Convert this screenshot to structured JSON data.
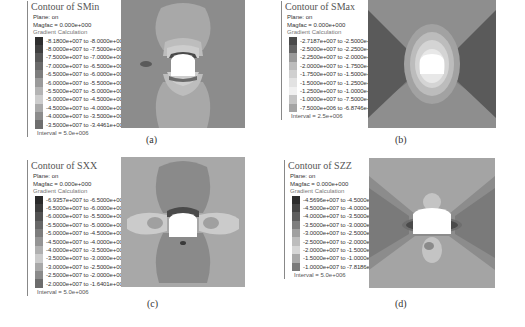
{
  "figure": {
    "panels": [
      {
        "id": "a",
        "caption": "(a)",
        "legend": {
          "title": "Contour of SMin",
          "plane": "Plane: on",
          "magfac": "Magfac =  0.000e+000",
          "gradient": "Gradient Calculation",
          "rows": [
            {
              "label": "-8.1800e+007 to -8.0000e+007",
              "color": "#2e2e2e"
            },
            {
              "label": "-8.0000e+007 to -7.5000e+007",
              "color": "#3f3f3f"
            },
            {
              "label": "-7.5000e+007 to -7.0000e+007",
              "color": "#575757"
            },
            {
              "label": "-7.0000e+007 to -6.5000e+007",
              "color": "#6a6a6a"
            },
            {
              "label": "-6.5000e+007 to -6.0000e+007",
              "color": "#7d7d7d"
            },
            {
              "label": "-6.0000e+007 to -5.5000e+007",
              "color": "#9a9a9a"
            },
            {
              "label": "-5.5000e+007 to -5.0000e+007",
              "color": "#b4b4b4"
            },
            {
              "label": "-5.0000e+007 to -4.5000e+007",
              "color": "#cdcdcd"
            },
            {
              "label": "-4.5000e+007 to -4.0000e+007",
              "color": "#a9a9a9"
            },
            {
              "label": "-4.0000e+007 to -3.5000e+007",
              "color": "#8c8c8c"
            },
            {
              "label": "-3.5000e+007 to -3.4461e+007",
              "color": "#6e6e6e"
            }
          ],
          "interval": "Interval =  5.0e+006"
        }
      },
      {
        "id": "b",
        "caption": "(b)",
        "legend": {
          "title": "Contour of SMax",
          "plane": "Plane: on",
          "magfac": "Magfac =  0.000e+000",
          "gradient": "Gradient Calculation",
          "rows": [
            {
              "label": "-2.7187e+007 to -2.5000e+007",
              "color": "#4a4a4a"
            },
            {
              "label": "-2.5000e+007 to -2.2500e+007",
              "color": "#646464"
            },
            {
              "label": "-2.2500e+007 to -2.0000e+007",
              "color": "#9a9a9a"
            },
            {
              "label": "-2.0000e+007 to -1.7500e+007",
              "color": "#bcbcbc"
            },
            {
              "label": "-1.7500e+007 to -1.5000e+007",
              "color": "#d0d0d0"
            },
            {
              "label": "-1.5000e+007 to -1.2500e+007",
              "color": "#e2e2e2"
            },
            {
              "label": "-1.2500e+007 to -1.0000e+007",
              "color": "#f0f0f0"
            },
            {
              "label": "-1.0000e+007 to -7.5000e+006",
              "color": "#c4c4c4"
            },
            {
              "label": "-7.5000e+006 to -6.8746e+006",
              "color": "#a4a4a4"
            }
          ],
          "interval": "Interval =  2.5e+006"
        }
      },
      {
        "id": "c",
        "caption": "(c)",
        "legend": {
          "title": "Contour of SXX",
          "plane": "Plane: on",
          "magfac": "Magfac =  0.000e+000",
          "gradient": "Gradient Calculation",
          "rows": [
            {
              "label": "-6.9357e+007 to -6.5000e+007",
              "color": "#2a2a2a"
            },
            {
              "label": "-6.5000e+007 to -6.0000e+007",
              "color": "#3c3c3c"
            },
            {
              "label": "-6.0000e+007 to -5.5000e+007",
              "color": "#525252"
            },
            {
              "label": "-5.5000e+007 to -5.0000e+007",
              "color": "#676767"
            },
            {
              "label": "-5.0000e+007 to -4.5000e+007",
              "color": "#7c7c7c"
            },
            {
              "label": "-4.5000e+007 to -4.0000e+007",
              "color": "#949494"
            },
            {
              "label": "-4.0000e+007 to -3.5000e+007",
              "color": "#b0b0b0"
            },
            {
              "label": "-3.5000e+007 to -3.0000e+007",
              "color": "#cbcbcb"
            },
            {
              "label": "-3.0000e+007 to -2.5000e+007",
              "color": "#a8a8a8"
            },
            {
              "label": "-2.5000e+007 to -2.0000e+007",
              "color": "#8a8a8a"
            },
            {
              "label": "-2.0000e+007 to -1.6401e+007",
              "color": "#6c6c6c"
            }
          ],
          "interval": "Interval =  5.0e+006"
        }
      },
      {
        "id": "d",
        "caption": "(d)",
        "legend": {
          "title": "Contour of SZZ",
          "plane": "Plane: on",
          "magfac": "Magfac =  0.000e+000",
          "gradient": "Gradient Calculation",
          "rows": [
            {
              "label": "-4.5696e+007 to -4.5000e+007",
              "color": "#2c2c2c"
            },
            {
              "label": "-4.5000e+007 to -4.0000e+007",
              "color": "#444444"
            },
            {
              "label": "-4.0000e+007 to -3.5000e+007",
              "color": "#5e5e5e"
            },
            {
              "label": "-3.5000e+007 to -3.0000e+007",
              "color": "#7e7e7e"
            },
            {
              "label": "-3.0000e+007 to -2.5000e+007",
              "color": "#a0a0a0"
            },
            {
              "label": "-2.5000e+007 to -2.0000e+007",
              "color": "#bdbdbd"
            },
            {
              "label": "-2.0000e+007 to -1.5000e+007",
              "color": "#d6d6d6"
            },
            {
              "label": "-1.5000e+007 to -1.0000e+007",
              "color": "#a9a9a9"
            },
            {
              "label": "-1.0000e+007 to -7.8186e+006",
              "color": "#7a7a7a"
            }
          ],
          "interval": "Interval =  5.0e+006"
        }
      }
    ]
  }
}
